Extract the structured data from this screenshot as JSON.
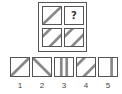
{
  "puzzle": {
    "grid": [
      {
        "position": "top-left",
        "pattern": "single-diagonal-stripe"
      },
      {
        "position": "top-right",
        "pattern": "question-mark",
        "label": "?"
      },
      {
        "position": "bottom-left",
        "pattern": "double-diagonal-stripes"
      },
      {
        "position": "bottom-right",
        "pattern": "double-diagonal-stripes"
      }
    ],
    "options": [
      {
        "label": "1",
        "pattern": "single-diagonal-stripe"
      },
      {
        "label": "2",
        "pattern": "reverse-diagonal-stripe"
      },
      {
        "label": "3",
        "pattern": "vertical-stripes"
      },
      {
        "label": "4",
        "pattern": "double-diagonal-stripes"
      },
      {
        "label": "5",
        "pattern": "single-vertical-stripe-right"
      }
    ]
  },
  "colors": {
    "stroke": "#555555",
    "stripe": "#888888",
    "background": "#ffffff"
  }
}
